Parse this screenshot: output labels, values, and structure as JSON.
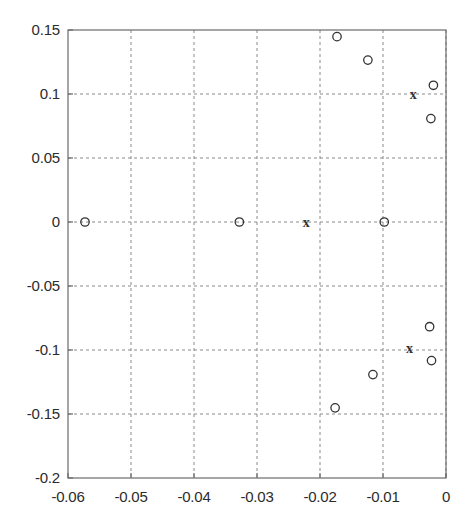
{
  "chart_data": {
    "type": "scatter",
    "title": "",
    "xlabel": "",
    "ylabel": "",
    "xlim": [
      -0.06,
      0.0
    ],
    "ylim": [
      -0.2,
      0.15
    ],
    "grid": true,
    "legend": null,
    "xticks": [
      "-0.06",
      "-0.05",
      "-0.04",
      "-0.03",
      "-0.02",
      "-0.01",
      "0"
    ],
    "xtick_values": [
      -0.06,
      -0.05,
      -0.04,
      -0.03,
      -0.02,
      -0.01,
      0.0
    ],
    "yticks": [
      "0.15",
      "0.1",
      "0.05",
      "0",
      "-0.05",
      "-0.1",
      "-0.15",
      "-0.2"
    ],
    "ytick_values": [
      0.15,
      0.1,
      0.05,
      0.0,
      -0.05,
      -0.1,
      -0.15,
      -0.2
    ],
    "series": [
      {
        "name": "zeros",
        "marker": "circle",
        "marker_label": "o",
        "color": "#333333",
        "points": [
          {
            "x": -0.0573,
            "y": 0.0
          },
          {
            "x": -0.0328,
            "y": 0.0
          },
          {
            "x": -0.0098,
            "y": 0.0
          },
          {
            "x": -0.0173,
            "y": 0.1448
          },
          {
            "x": -0.0124,
            "y": 0.1265
          },
          {
            "x": -0.002,
            "y": 0.1068
          },
          {
            "x": -0.0024,
            "y": 0.0808
          },
          {
            "x": -0.0026,
            "y": -0.0818
          },
          {
            "x": -0.0023,
            "y": -0.1083
          },
          {
            "x": -0.0116,
            "y": -0.1192
          },
          {
            "x": -0.0176,
            "y": -0.1452
          }
        ]
      },
      {
        "name": "poles",
        "marker": "cross",
        "marker_label": "x",
        "color": "#333333",
        "points": [
          {
            "x": -0.0222,
            "y": 0.0
          },
          {
            "x": -0.0052,
            "y": 0.1
          },
          {
            "x": -0.0058,
            "y": -0.0988
          }
        ]
      }
    ]
  }
}
